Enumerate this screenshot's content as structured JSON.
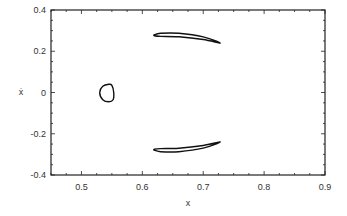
{
  "chart_data": {
    "type": "line",
    "title": "",
    "xlabel": "x",
    "ylabel": "ẋ",
    "xlim": [
      0.45,
      0.9
    ],
    "ylim": [
      -0.4,
      0.4
    ],
    "grid": false,
    "legend": null,
    "x_ticks": [
      0.5,
      0.6,
      0.7,
      0.8,
      0.9
    ],
    "x_tick_labels": [
      "0.5",
      "0.6",
      "0.7",
      "0.8",
      "0.9"
    ],
    "y_ticks": [
      0.4,
      0.2,
      0,
      -0.2,
      -0.4
    ],
    "y_tick_labels": [
      "0.4",
      "0.2",
      "0",
      "-0.2",
      "-0.4"
    ],
    "series": [
      {
        "name": "closed-orbit-center",
        "closed": true,
        "points": [
          [
            0.545,
            0.04
          ],
          [
            0.55,
            0.035
          ],
          [
            0.553,
            0.0
          ],
          [
            0.552,
            -0.035
          ],
          [
            0.545,
            -0.045
          ],
          [
            0.535,
            -0.035
          ],
          [
            0.53,
            0.0
          ],
          [
            0.535,
            0.03
          ],
          [
            0.545,
            0.04
          ]
        ]
      },
      {
        "name": "closed-orbit-upper",
        "closed": true,
        "points": [
          [
            0.62,
            0.28
          ],
          [
            0.63,
            0.287
          ],
          [
            0.66,
            0.287
          ],
          [
            0.7,
            0.27
          ],
          [
            0.728,
            0.24
          ],
          [
            0.7,
            0.257
          ],
          [
            0.66,
            0.27
          ],
          [
            0.63,
            0.272
          ],
          [
            0.62,
            0.275
          ],
          [
            0.62,
            0.28
          ]
        ]
      },
      {
        "name": "closed-orbit-lower",
        "closed": true,
        "points": [
          [
            0.62,
            -0.28
          ],
          [
            0.63,
            -0.287
          ],
          [
            0.66,
            -0.287
          ],
          [
            0.7,
            -0.27
          ],
          [
            0.728,
            -0.24
          ],
          [
            0.7,
            -0.257
          ],
          [
            0.66,
            -0.27
          ],
          [
            0.63,
            -0.272
          ],
          [
            0.62,
            -0.275
          ],
          [
            0.62,
            -0.28
          ]
        ]
      }
    ]
  },
  "style": {
    "line_color": "#111111",
    "axis_color": "#222222",
    "text_color": "#333333"
  }
}
